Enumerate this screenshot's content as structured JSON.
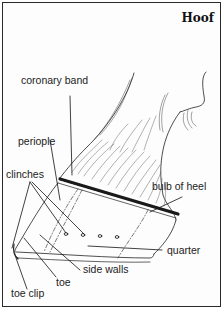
{
  "title": "Hoof",
  "labels": {
    "coronary_band": "coronary band",
    "periople": "periople",
    "clinches": "clinches",
    "bulb_of_heel": "bulb of heel",
    "quarter": "quarter",
    "side_walls": "side walls",
    "toe": "toe",
    "toe_clip": "toe clip"
  },
  "colors": {
    "ink": "#222222",
    "background": "#fdfdfd",
    "border": "#2a2a2a"
  }
}
